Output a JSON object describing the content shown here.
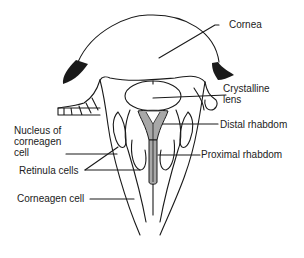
{
  "diagram": {
    "labels": {
      "cornea": "Cornea",
      "crystalline_lens_1": "Crystalline",
      "crystalline_lens_2": "lens",
      "distal_rhabdom": "Distal rhabdom",
      "proximal_rhabdom": "Proximal rhabdom",
      "nucleus_1": "Nucleus of",
      "nucleus_2": "corneagen",
      "nucleus_3": "cell",
      "retinula_cells": "Retinula cells",
      "corneagen_cell": "Corneagen cell"
    },
    "colors": {
      "line": "#1a1a1a",
      "pigment": "#1a1a1a",
      "rhabdom_fill": "#a8a8a8",
      "background": "#ffffff"
    }
  }
}
